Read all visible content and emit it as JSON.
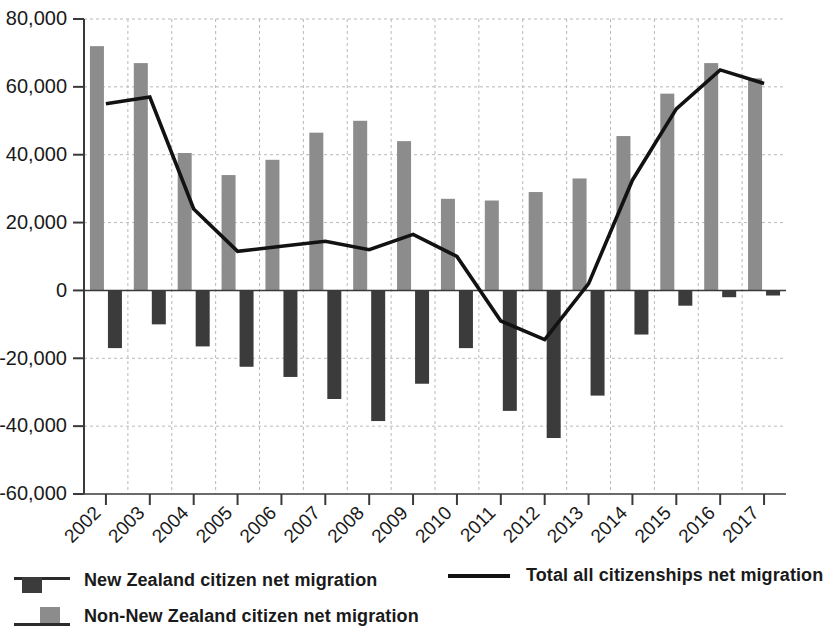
{
  "chart_data": {
    "type": "bar",
    "title": "",
    "subtitle": "",
    "xlabel": "",
    "ylabel": "",
    "grid": true,
    "legend_position": "bottom",
    "categories": [
      "2002",
      "2003",
      "2004",
      "2005",
      "2006",
      "2007",
      "2008",
      "2009",
      "2010",
      "2011",
      "2012",
      "2013",
      "2014",
      "2015",
      "2016",
      "2017"
    ],
    "ylim": [
      -60000,
      80000
    ],
    "ytick_values": [
      80000,
      60000,
      40000,
      20000,
      0,
      -20000,
      -40000,
      -60000
    ],
    "ytick_labels": [
      "80,000",
      "60,000",
      "40,000",
      "20,000",
      "0",
      "-20,000",
      "-40,000",
      "-60,000"
    ],
    "series": [
      {
        "name": "Non-New Zealand citizen net migration",
        "kind": "bar",
        "color": "#8c8c8c",
        "values": [
          72000,
          67000,
          40500,
          34000,
          38500,
          46500,
          50000,
          44000,
          27000,
          26500,
          29000,
          33000,
          45500,
          58000,
          67000,
          62500
        ]
      },
      {
        "name": "New Zealand citizen net migration",
        "kind": "bar",
        "color": "#3b3b3b",
        "values": [
          -17000,
          -10000,
          -16500,
          -22500,
          -25500,
          -32000,
          -38500,
          -27500,
          -17000,
          -35500,
          -43500,
          -31000,
          -13000,
          -4500,
          -2000,
          -1500
        ]
      },
      {
        "name": "Total all citizenships net migration",
        "kind": "line",
        "color": "#121212",
        "values": [
          55000,
          57000,
          24000,
          11500,
          13000,
          14500,
          12000,
          16500,
          10000,
          -9000,
          -14500,
          2000,
          32500,
          53500,
          65000,
          61000
        ]
      }
    ]
  },
  "legend": {
    "items": [
      {
        "label": "New Zealand citizen net migration",
        "marker": "bar-dark",
        "color": "#3b3b3b"
      },
      {
        "label": "Non-New Zealand citizen net migration",
        "marker": "bar-grey",
        "color": "#8c8c8c"
      },
      {
        "label": "Total all citizenships net migration",
        "marker": "line",
        "color": "#121212"
      }
    ]
  }
}
